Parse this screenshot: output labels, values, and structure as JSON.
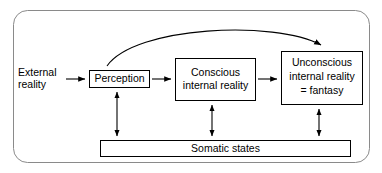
{
  "diagram": {
    "type": "flow-diagram",
    "title_visible": false,
    "frame": {
      "stroke": "#8a8a8a",
      "fill": "#ffffff",
      "rounded": true
    },
    "colors": {
      "line": "#000000",
      "box_stroke": "#000000",
      "background": "#ffffff",
      "frame_stroke": "#8a8a8a"
    },
    "labels": {
      "external_reality_line1": "External",
      "external_reality_line2": "reality",
      "perception": "Perception",
      "conscious_line1": "Conscious",
      "conscious_line2": "internal reality",
      "unconscious_line1": "Unconscious",
      "unconscious_line2": "internal reality",
      "unconscious_line3": "= fantasy",
      "somatic_states": "Somatic states"
    },
    "nodes": [
      {
        "id": "external-reality",
        "label": "External reality",
        "boxed": false
      },
      {
        "id": "perception",
        "label": "Perception",
        "boxed": true
      },
      {
        "id": "conscious-internal-reality",
        "label": "Conscious internal reality",
        "boxed": true
      },
      {
        "id": "unconscious-internal-reality",
        "label": "Unconscious internal reality = fantasy",
        "boxed": true
      },
      {
        "id": "somatic-states",
        "label": "Somatic states",
        "boxed": true
      }
    ],
    "edges": [
      {
        "from": "external-reality",
        "to": "perception",
        "style": "arrow",
        "direction": "one-way"
      },
      {
        "from": "perception",
        "to": "conscious-internal-reality",
        "style": "arrow",
        "direction": "one-way"
      },
      {
        "from": "conscious-internal-reality",
        "to": "unconscious-internal-reality",
        "style": "arrow",
        "direction": "one-way"
      },
      {
        "from": "perception",
        "to": "unconscious-internal-reality",
        "style": "curved-arrow",
        "direction": "one-way"
      },
      {
        "from": "perception",
        "to": "somatic-states",
        "style": "arrow",
        "direction": "two-way"
      },
      {
        "from": "conscious-internal-reality",
        "to": "somatic-states",
        "style": "arrow",
        "direction": "two-way"
      },
      {
        "from": "unconscious-internal-reality",
        "to": "somatic-states",
        "style": "arrow",
        "direction": "two-way"
      }
    ]
  }
}
